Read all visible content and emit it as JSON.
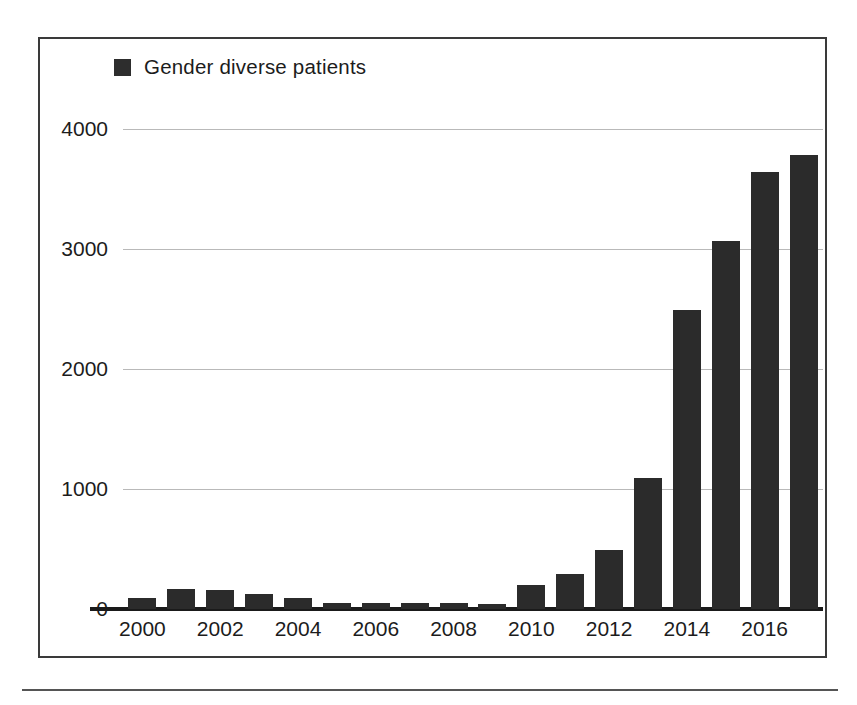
{
  "figure": {
    "frame_border_color": "#3a3a3a",
    "background_color": "#ffffff",
    "has_bottom_rule": true
  },
  "legend": {
    "swatch_icon": "legend-swatch-square",
    "swatch_color": "#2d2d2d",
    "label": "Gender diverse patients"
  },
  "chart_data": {
    "type": "bar",
    "title": "",
    "subtitle": "",
    "xlabel": "",
    "ylabel": "",
    "legend": [
      "Gender diverse patients"
    ],
    "legend_position": "top-left",
    "grid": true,
    "grid_axis": "y",
    "bar_color": "#2b2b2b",
    "ylim": [
      0,
      4200
    ],
    "yticks": [
      0,
      1000,
      2000,
      3000,
      4000
    ],
    "ytick_labels": [
      "0",
      "1000",
      "2000",
      "3000",
      "4000"
    ],
    "xticks": [
      2000,
      2002,
      2004,
      2006,
      2008,
      2010,
      2012,
      2014,
      2016
    ],
    "xtick_labels": [
      "2000",
      "2002",
      "2004",
      "2006",
      "2008",
      "2010",
      "2012",
      "2014",
      "2016"
    ],
    "categories": [
      "2000",
      "2001",
      "2002",
      "2003",
      "2004",
      "2005",
      "2006",
      "2007",
      "2008",
      "2009",
      "2010",
      "2011",
      "2012",
      "2013",
      "2014",
      "2015",
      "2016",
      "2017"
    ],
    "series": [
      {
        "name": "Gender diverse patients",
        "values": [
          90,
          170,
          155,
          125,
          95,
          50,
          50,
          48,
          48,
          45,
          200,
          290,
          490,
          1090,
          2490,
          3070,
          3640,
          3780
        ]
      }
    ]
  }
}
